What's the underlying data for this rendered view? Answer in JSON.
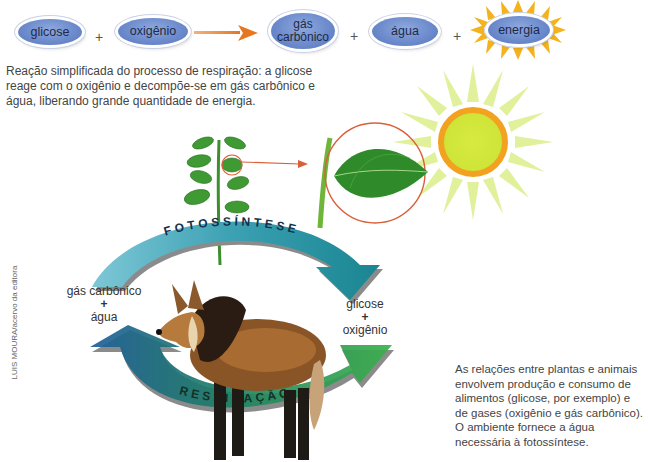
{
  "equation": {
    "reactants": [
      "glicose",
      "oxigênio"
    ],
    "products": [
      "gás carbônico",
      "água",
      "energia"
    ],
    "plus_sign": "+",
    "arrow_color": "#e8761e",
    "pill_color": "#6d8bcd",
    "sun_burst_color": "#f4b21c"
  },
  "equation_caption": "Reação simplificada do processo de respiração: a glicose reage com o oxigênio e decompõe-se em gás carbônico e água, liberando grande quantidade de energia.",
  "cycle": {
    "top_arrow_label": "FOTOSSÍNTESE",
    "bottom_arrow_label": "RESPIRAÇÃO",
    "left_label": {
      "line1": "gás carbônico",
      "plus": "+",
      "line2": "água"
    },
    "right_label": {
      "line1": "glicose",
      "plus": "+",
      "line2": "oxigênio"
    },
    "top_arrow_color": "#3aa0b2",
    "bottom_arrow_color_start": "#1f5e9a",
    "bottom_arrow_color_end": "#3bb04a",
    "highlight_circle_color": "#d9603a"
  },
  "illustrations": {
    "plant": "plant-seedling",
    "leaf": "leaf-magnified",
    "sun": "sun",
    "animal": "maned-wolf"
  },
  "side_caption": "As relações entre plantas e animais envolvem produção e consumo de alimentos (glicose, por exemplo) e de gases (oxigênio e gás carbônico). O ambiente fornece a água necessária à fotossíntese.",
  "credit": "LUIS MOURA/acervo da editora"
}
